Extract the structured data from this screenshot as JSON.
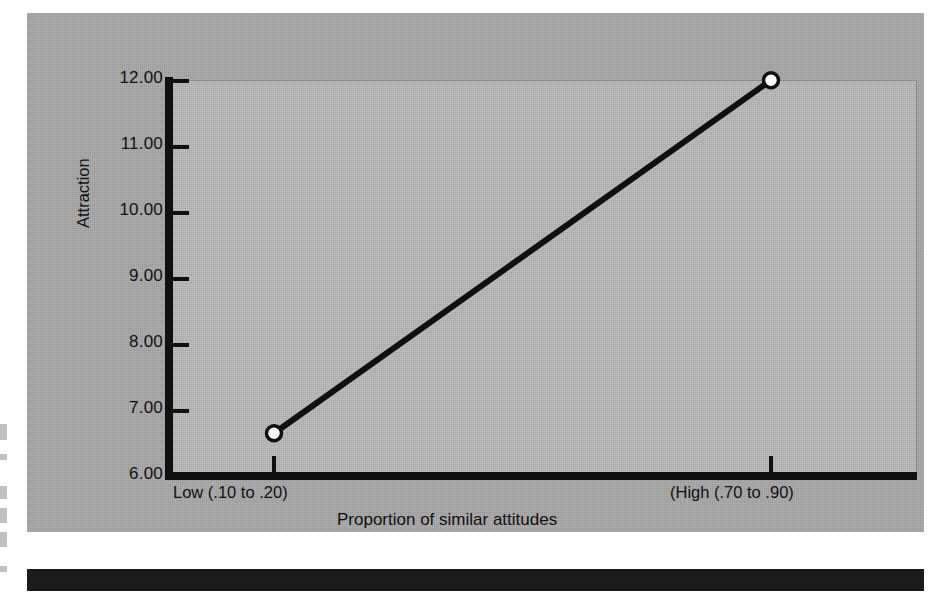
{
  "figure": {
    "panel_color": "#a8a8a8",
    "plot_color": "#b9b9b9",
    "axis_color": "#101010",
    "rule_color": "#1b1b1b"
  },
  "chart_data": {
    "type": "line",
    "title": "",
    "subtitle": "",
    "xlabel": "Proportion of similar attitudes",
    "ylabel": "Attraction",
    "categories": [
      "Low (.10 to .20)",
      "(High (.70 to .90)"
    ],
    "x_tick_labels": [
      "Low (.10 to .20)",
      "(High (.70 to .90)"
    ],
    "y_tick_labels": [
      "12.00",
      "11.00",
      "10.00",
      "9.00",
      "8.00",
      "7.00",
      "6.00"
    ],
    "y_ticks": [
      12,
      11,
      10,
      9,
      8,
      7,
      6
    ],
    "ylim": [
      6.0,
      12.0
    ],
    "xlim": [
      0,
      1
    ],
    "grid": false,
    "legend": false,
    "legend_position": "none",
    "marker": "open-circle",
    "line_color": "#101010",
    "marker_face_color": "#ffffff",
    "series": [
      {
        "name": "Attraction",
        "x": [
          "Low (.10 to .20)",
          "(High (.70 to .90)"
        ],
        "values": [
          6.45,
          11.8
        ]
      }
    ],
    "annotations": []
  },
  "marks": {
    "edge_fragments": 6
  }
}
